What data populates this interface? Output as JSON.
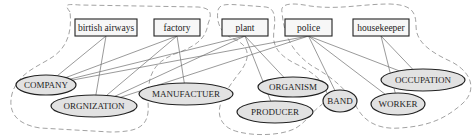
{
  "diagram": {
    "entities": [
      {
        "id": "birtish_airways",
        "label": "birtish airways",
        "x": 75,
        "y": 19,
        "w": 62,
        "h": 17
      },
      {
        "id": "factory",
        "label": "factory",
        "x": 154,
        "y": 19,
        "w": 46,
        "h": 17
      },
      {
        "id": "plant",
        "label": "plant",
        "x": 222,
        "y": 19,
        "w": 46,
        "h": 17
      },
      {
        "id": "police",
        "label": "police",
        "x": 285,
        "y": 19,
        "w": 47,
        "h": 17
      },
      {
        "id": "housekeeper",
        "label": "housekeeper",
        "x": 353,
        "y": 19,
        "w": 56,
        "h": 17
      }
    ],
    "concepts": [
      {
        "id": "company",
        "label": "COMPANY",
        "cx": 46,
        "cy": 85,
        "rx": 30,
        "ry": 10
      },
      {
        "id": "orgnization",
        "label": "ORGNIZATION",
        "cx": 94,
        "cy": 106,
        "rx": 43,
        "ry": 11
      },
      {
        "id": "manufactuer",
        "label": "MANUFACTUER",
        "cx": 186,
        "cy": 94,
        "rx": 47,
        "ry": 11
      },
      {
        "id": "producer",
        "label": "PRODUCER",
        "cx": 275,
        "cy": 112,
        "rx": 38,
        "ry": 11
      },
      {
        "id": "organism",
        "label": "ORGANISM",
        "cx": 293,
        "cy": 87,
        "rx": 35,
        "ry": 10
      },
      {
        "id": "band",
        "label": "BAND",
        "cx": 340,
        "cy": 101,
        "rx": 17,
        "ry": 11
      },
      {
        "id": "worker",
        "label": "WORKER",
        "cx": 398,
        "cy": 104,
        "rx": 27,
        "ry": 11
      },
      {
        "id": "occupation",
        "label": "OCCUPATION",
        "cx": 423,
        "cy": 80,
        "rx": 42,
        "ry": 11
      }
    ],
    "edges": [
      [
        "birtish_airways",
        "company"
      ],
      [
        "birtish_airways",
        "orgnization"
      ],
      [
        "factory",
        "company"
      ],
      [
        "factory",
        "orgnization"
      ],
      [
        "factory",
        "manufactuer"
      ],
      [
        "plant",
        "company"
      ],
      [
        "plant",
        "orgnization"
      ],
      [
        "plant",
        "producer"
      ],
      [
        "plant",
        "organism"
      ],
      [
        "police",
        "company"
      ],
      [
        "police",
        "orgnization"
      ],
      [
        "police",
        "band"
      ],
      [
        "police",
        "worker"
      ],
      [
        "police",
        "occupation"
      ],
      [
        "housekeeper",
        "worker"
      ],
      [
        "housekeeper",
        "occupation"
      ]
    ],
    "regions": [
      {
        "id": "region-company-org",
        "d": "M70,12 C64,4 66,4 80,5 L198,7 C212,8 212,14 208,24 C206,36 200,44 180,52 C150,62 148,78 148,102 C150,126 140,132 110,132 L40,128 C14,124 8,110 12,94 C18,72 40,66 54,56 C68,46 72,30 70,12 Z"
      },
      {
        "id": "region-plant",
        "d": "M218,10 C220,4 226,4 240,5 L266,7 C274,8 276,16 274,30 C272,44 276,54 296,64 C326,78 334,96 320,106 C312,112 306,122 296,128 C278,138 236,136 226,126 C210,112 226,90 240,72 C252,56 248,46 236,40 C220,34 216,22 218,10 Z"
      },
      {
        "id": "region-police",
        "d": "M282,12 C280,4 290,2 310,6 C340,10 360,4 390,4 C410,5 416,10 416,26 C416,42 430,52 452,62 C474,74 476,92 462,104 C446,118 430,126 400,128 C374,130 362,118 356,106 C346,88 330,76 312,66 C292,52 284,36 282,12 Z"
      }
    ]
  }
}
